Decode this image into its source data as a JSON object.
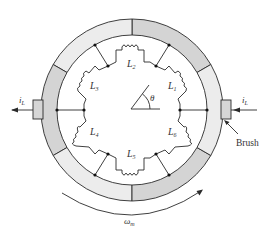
{
  "figure": {
    "type": "dc-machine-commutator-schematic",
    "inductors": [
      {
        "id": "L1",
        "base": "L",
        "sub": "1"
      },
      {
        "id": "L2",
        "base": "L",
        "sub": "2"
      },
      {
        "id": "L3",
        "base": "L",
        "sub": "3"
      },
      {
        "id": "L4",
        "base": "L",
        "sub": "4"
      },
      {
        "id": "L5",
        "base": "L",
        "sub": "5"
      },
      {
        "id": "L6",
        "base": "L",
        "sub": "6"
      }
    ],
    "angle_label": "θ",
    "current_left": {
      "base": "i",
      "sub": "L"
    },
    "current_right": {
      "base": "i",
      "sub": "L"
    },
    "brush_label": "Brush",
    "speed_label": {
      "base": "ω",
      "sub": "m"
    },
    "colors": {
      "segment_dark": "#d4d4d4",
      "segment_light": "#ececec",
      "brush": "#d6d6d6",
      "line": "#2a2a2a"
    }
  }
}
